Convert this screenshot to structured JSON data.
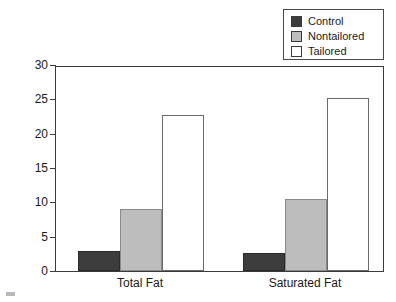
{
  "chart_data": {
    "type": "bar",
    "title": "",
    "xlabel": "",
    "ylabel": "Percent Decrease in Fat Consumed",
    "categories": [
      "Total Fat",
      "Saturated Fat"
    ],
    "series": [
      {
        "name": "Control",
        "color": "#3d3d3d",
        "values": [
          2.9,
          2.6
        ]
      },
      {
        "name": "Nontailored",
        "color": "#bdbdbd",
        "values": [
          9.0,
          10.5
        ]
      },
      {
        "name": "Tailored",
        "color": "#ffffff",
        "values": [
          22.7,
          25.2
        ]
      }
    ],
    "ylim": [
      0,
      30
    ],
    "yticks": [
      0,
      5,
      10,
      15,
      20,
      25,
      30
    ],
    "ytick_labels": [
      "0",
      "5",
      "10",
      "15",
      "20",
      "25",
      "30"
    ],
    "grid": false,
    "legend_position": "top-right"
  },
  "legend": {
    "entries": [
      {
        "label": "Control",
        "color": "#3d3d3d"
      },
      {
        "label": "Nontailored",
        "color": "#bdbdbd"
      },
      {
        "label": "Tailored",
        "color": "#ffffff"
      }
    ]
  }
}
